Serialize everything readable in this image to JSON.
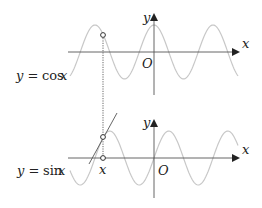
{
  "diagram": {
    "colors": {
      "axis": "#555555",
      "curve": "#c8c8c8",
      "tangent": "#555555",
      "text": "#222222",
      "dotted": "#555555"
    },
    "top_plot": {
      "curve_label_prefix": "y = ",
      "curve_label_func": "cos",
      "curve_label_var": "x",
      "y_axis_label": "y",
      "x_axis_label": "x",
      "origin_label": "O"
    },
    "bottom_plot": {
      "curve_label_prefix": "y = ",
      "curve_label_func": "sin",
      "curve_label_var": "x",
      "y_axis_label": "y",
      "x_axis_label": "x",
      "origin_label": "O",
      "point_label": "x"
    }
  }
}
